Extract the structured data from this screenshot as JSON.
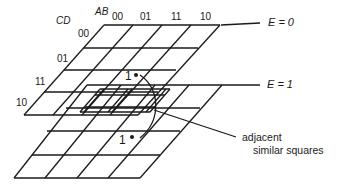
{
  "figure": {
    "type": "3D Karnaugh map (5-variable, two stacked 4x4 planes)",
    "variables": {
      "column_var": "AB",
      "row_var": "CD",
      "plane_var": "E"
    },
    "column_labels": [
      "00",
      "01",
      "11",
      "10"
    ],
    "row_labels": [
      "00",
      "01",
      "11",
      "10"
    ],
    "planes": [
      {
        "label": "E = 0",
        "position": "top"
      },
      {
        "label": "E = 1",
        "position": "bottom"
      }
    ],
    "markers": [
      {
        "text": "1",
        "plane": "E = 0"
      },
      {
        "text": "1",
        "plane": "E = 1"
      }
    ],
    "annotation": {
      "line1": "adjacent",
      "line2": "similar squares"
    },
    "stroke_color": "#1a1a1a",
    "background_color": "#ffffff"
  }
}
